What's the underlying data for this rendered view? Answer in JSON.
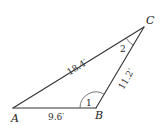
{
  "diagram": {
    "type": "triangle",
    "vertices": {
      "A": {
        "label": "A",
        "x": 13,
        "y": 108
      },
      "B": {
        "label": "B",
        "x": 96,
        "y": 108
      },
      "C": {
        "label": "C",
        "x": 144,
        "y": 27
      }
    },
    "sides": {
      "AB": {
        "label": "9.6′"
      },
      "AC": {
        "label": "18.4′"
      },
      "BC": {
        "label": "11.2′"
      }
    },
    "angles": {
      "B": {
        "label": "1"
      },
      "C": {
        "label": "2"
      }
    },
    "colors": {
      "stroke": "#333333",
      "background": "#ffffff"
    }
  }
}
